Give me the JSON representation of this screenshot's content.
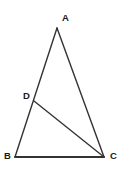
{
  "figure": {
    "kind": "geometry-diagram",
    "width": 123,
    "height": 174,
    "background_color": "#ffffff",
    "stroke_color": "#333333",
    "label_color": "#1a1a1a",
    "points": [
      {
        "id": "A",
        "label": "A",
        "x": 57,
        "y": 28,
        "label_x": 62,
        "label_y": 13
      },
      {
        "id": "B",
        "label": "B",
        "x": 15,
        "y": 157,
        "label_x": 4,
        "label_y": 151
      },
      {
        "id": "C",
        "label": "C",
        "x": 104,
        "y": 157,
        "label_x": 110,
        "label_y": 151
      },
      {
        "id": "D",
        "label": "D",
        "x": 34,
        "y": 101,
        "label_x": 23,
        "label_y": 91
      }
    ],
    "segments": [
      {
        "id": "AB",
        "from": "A",
        "to": "B",
        "x1": 57,
        "y1": 28,
        "x2": 15,
        "y2": 157
      },
      {
        "id": "AC",
        "from": "A",
        "to": "C",
        "x1": 57,
        "y1": 28,
        "x2": 104,
        "y2": 157
      },
      {
        "id": "BC",
        "from": "B",
        "to": "C",
        "x1": 15,
        "y1": 157,
        "x2": 104,
        "y2": 157
      },
      {
        "id": "DC",
        "from": "D",
        "to": "C",
        "x1": 34,
        "y1": 101,
        "x2": 104,
        "y2": 157
      }
    ]
  }
}
